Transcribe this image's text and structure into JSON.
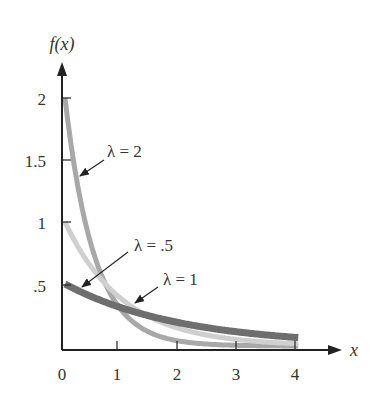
{
  "chart_data": {
    "type": "line",
    "title": "",
    "xlabel": "x",
    "ylabel": "f(x)",
    "xlim": [
      0,
      4
    ],
    "ylim": [
      0,
      2.2
    ],
    "grid": false,
    "x_ticks": [
      "0",
      "1",
      "2",
      "3",
      "4"
    ],
    "y_ticks": [
      ".5",
      "1",
      "1.5",
      "2"
    ],
    "function": "f(x) = λ e^(-λx)",
    "series": [
      {
        "name": "λ = 2",
        "lambda": 2,
        "color": "#a8a8a8",
        "x": [
          0,
          0.25,
          0.5,
          0.75,
          1,
          1.5,
          2,
          2.5,
          3,
          3.5,
          4
        ],
        "values": [
          2.0,
          1.21,
          0.74,
          0.45,
          0.27,
          0.1,
          0.04,
          0.01,
          0.005,
          0.002,
          0.001
        ]
      },
      {
        "name": "λ = 1",
        "lambda": 1,
        "color": "#cfcfcf",
        "x": [
          0,
          0.25,
          0.5,
          0.75,
          1,
          1.5,
          2,
          2.5,
          3,
          3.5,
          4
        ],
        "values": [
          1.0,
          0.78,
          0.61,
          0.47,
          0.37,
          0.22,
          0.14,
          0.08,
          0.05,
          0.03,
          0.02
        ]
      },
      {
        "name": "λ = .5",
        "lambda": 0.5,
        "color": "#6e6e6e",
        "x": [
          0,
          0.25,
          0.5,
          0.75,
          1,
          1.5,
          2,
          2.5,
          3,
          3.5,
          4
        ],
        "values": [
          0.5,
          0.44,
          0.39,
          0.34,
          0.3,
          0.24,
          0.18,
          0.14,
          0.11,
          0.09,
          0.07
        ]
      }
    ],
    "annotations": [
      {
        "text": "λ = 2",
        "points_to": "λ = 2 curve"
      },
      {
        "text": "λ = .5",
        "points_to": "λ = .5 curve"
      },
      {
        "text": "λ = 1",
        "points_to": "λ = 1 curve"
      }
    ]
  },
  "labels": {
    "ylabel": "f(x)",
    "xlabel": "x",
    "x_ticks": [
      "0",
      "1",
      "2",
      "3",
      "4"
    ],
    "y_ticks": [
      "2",
      "1.5",
      "1",
      ".5"
    ],
    "ann_l2": "λ = 2",
    "ann_l05": "λ = .5",
    "ann_l1": "λ = 1"
  }
}
